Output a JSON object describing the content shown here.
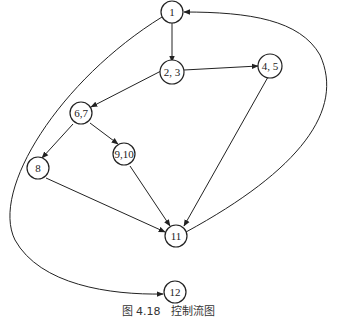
{
  "diagram": {
    "caption": "图 4.18　控制流图",
    "nodes": [
      {
        "id": "n1",
        "label": "1"
      },
      {
        "id": "n23",
        "label": "2, 3"
      },
      {
        "id": "n45",
        "label": "4, 5"
      },
      {
        "id": "n67",
        "label": "6,7"
      },
      {
        "id": "n910",
        "label": "9,10"
      },
      {
        "id": "n8",
        "label": "8"
      },
      {
        "id": "n11",
        "label": "11"
      },
      {
        "id": "n12",
        "label": "12"
      }
    ],
    "edges": [
      {
        "from": "1",
        "to": "2, 3"
      },
      {
        "from": "2, 3",
        "to": "4, 5"
      },
      {
        "from": "2, 3",
        "to": "6,7"
      },
      {
        "from": "6,7",
        "to": "8"
      },
      {
        "from": "6,7",
        "to": "9,10"
      },
      {
        "from": "8",
        "to": "11"
      },
      {
        "from": "9,10",
        "to": "11"
      },
      {
        "from": "4, 5",
        "to": "11"
      },
      {
        "from": "11",
        "to": "1"
      },
      {
        "from": "1",
        "to": "12"
      }
    ]
  }
}
